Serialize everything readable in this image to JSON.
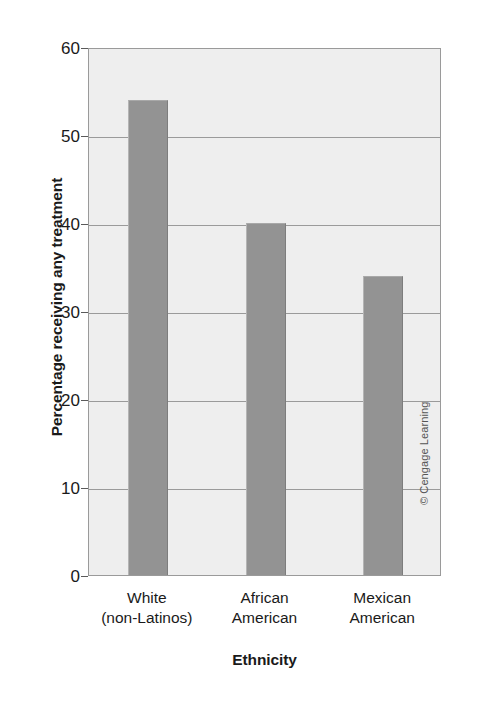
{
  "chart_data": {
    "type": "bar",
    "title": "",
    "subtitle": "",
    "categories": [
      "White\n(non-Latinos)",
      "African\nAmerican",
      "Mexican\nAmerican"
    ],
    "category_lines": [
      [
        "White",
        "(non-Latinos)"
      ],
      [
        "African",
        "American"
      ],
      [
        "Mexican",
        "American"
      ]
    ],
    "values": [
      54,
      40,
      34
    ],
    "xlabel": "Ethnicity",
    "ylabel": "Percentage receiving any treatment",
    "ylim": [
      0,
      60
    ],
    "ytick_values": [
      60,
      50,
      40,
      30,
      20,
      10,
      0
    ],
    "ytick_labels": [
      "60",
      "50",
      "40",
      "30",
      "20",
      "10",
      "0"
    ],
    "grid": true,
    "legend": false,
    "legend_position": "none",
    "bar_color": "#939393",
    "plot_background": "#eeeeee",
    "axis_color": "#9a9a9a"
  },
  "credit": {
    "text": "© Cengage Learning"
  }
}
